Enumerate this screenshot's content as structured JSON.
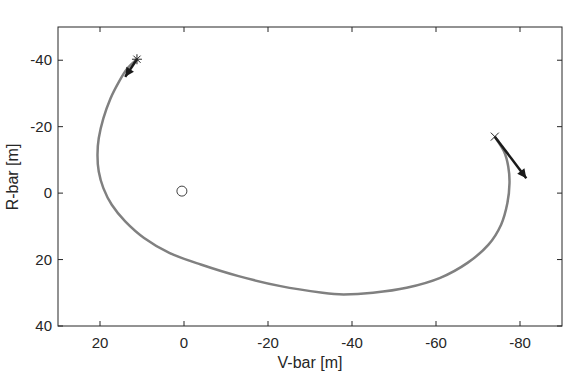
{
  "chart_data": {
    "type": "line",
    "title": "",
    "xlabel": "V-bar [m]",
    "ylabel": "R-bar [m]",
    "xlim": [
      30,
      -90
    ],
    "ylim": [
      -50,
      40
    ],
    "x_reversed": true,
    "y_reversed": true,
    "grid": false,
    "legend": null,
    "xticks": [
      20,
      0,
      -20,
      -40,
      -60,
      -80
    ],
    "xtick_labels": [
      "20",
      "0",
      "-20",
      "-40",
      "-60",
      "-80"
    ],
    "yticks": [
      -40,
      -20,
      0,
      20,
      40
    ],
    "ytick_labels": [
      "-40",
      "-20",
      "0",
      "20",
      "40"
    ],
    "series": [
      {
        "name": "trajectory",
        "color": "#808080",
        "points": [
          [
            11.2,
            -40.3
          ],
          [
            13.5,
            -37.5
          ],
          [
            15.5,
            -33.5
          ],
          [
            17.5,
            -28.5
          ],
          [
            19.2,
            -22.5
          ],
          [
            20.3,
            -16.5
          ],
          [
            20.6,
            -11.5
          ],
          [
            20.3,
            -6.5
          ],
          [
            19.2,
            -1.5
          ],
          [
            17.2,
            3.5
          ],
          [
            14.0,
            8.5
          ],
          [
            9.5,
            13.5
          ],
          [
            3.5,
            18.0
          ],
          [
            -4.0,
            21.5
          ],
          [
            -13.0,
            25.0
          ],
          [
            -23.0,
            28.0
          ],
          [
            -33.0,
            30.0
          ],
          [
            -38.0,
            30.5
          ],
          [
            -45.0,
            30.0
          ],
          [
            -53.0,
            28.5
          ],
          [
            -61.0,
            25.5
          ],
          [
            -67.5,
            21.0
          ],
          [
            -72.5,
            15.5
          ],
          [
            -75.5,
            9.5
          ],
          [
            -77.0,
            3.0
          ],
          [
            -77.5,
            -3.0
          ],
          [
            -77.2,
            -8.0
          ],
          [
            -76.2,
            -12.5
          ],
          [
            -74.0,
            -17.0
          ]
        ]
      }
    ],
    "markers": [
      {
        "name": "start",
        "symbol": "asterisk",
        "x": 11.2,
        "y": -40.3
      },
      {
        "name": "end",
        "symbol": "x",
        "x": -74.0,
        "y": -17.0
      },
      {
        "name": "target",
        "symbol": "circle",
        "x": 0.5,
        "y": -0.6
      }
    ],
    "arrows": [
      {
        "name": "start-velocity",
        "from": [
          11.2,
          -40.3
        ],
        "to": [
          14.0,
          -35.0
        ]
      },
      {
        "name": "end-velocity",
        "from": [
          -74.0,
          -17.0
        ],
        "to": [
          -81.5,
          -4.5
        ]
      }
    ]
  }
}
